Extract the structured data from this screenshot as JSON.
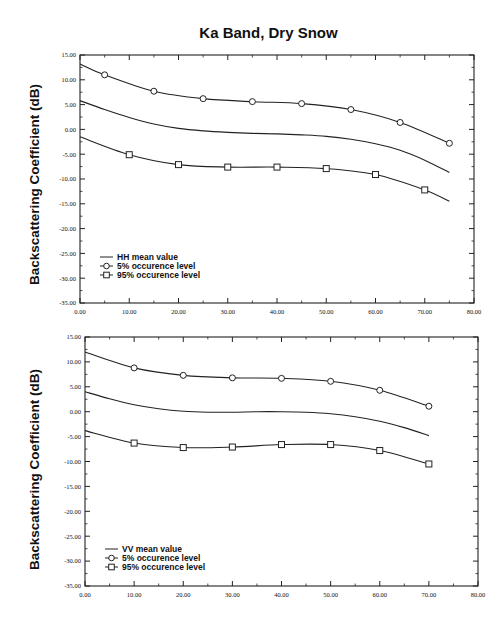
{
  "title": "Ka Band, Dry Snow",
  "chart_data": [
    {
      "type": "line",
      "panel": "top",
      "title": "Ka Band, Dry Snow",
      "xlabel": "",
      "ylabel": "Backscattering Coefficient (dB)",
      "xlim": [
        0,
        80
      ],
      "ylim": [
        -35,
        15
      ],
      "x_ticks": [
        "0.00",
        "10.00",
        "20.00",
        "30.00",
        "40.00",
        "50.00",
        "60.00",
        "70.00",
        "80.00"
      ],
      "y_ticks": [
        "15.00",
        "10.00",
        "5.00",
        "0.00",
        "-5.00",
        "-10.00",
        "-15.00",
        "-20.00",
        "-25.00",
        "-30.00",
        "-35.00"
      ],
      "grid": false,
      "legend_position": "lower-left",
      "series": [
        {
          "name": "HH mean value",
          "marker": "none",
          "x": [
            0,
            5,
            10,
            15,
            20,
            25,
            30,
            35,
            40,
            45,
            50,
            55,
            60,
            65,
            70,
            75
          ],
          "y": [
            5.8,
            4.0,
            2.4,
            1.1,
            0.2,
            -0.3,
            -0.6,
            -0.8,
            -0.9,
            -1.1,
            -1.4,
            -2.0,
            -2.9,
            -4.2,
            -6.2,
            -8.7
          ]
        },
        {
          "name": "5% occurence level",
          "marker": "circle",
          "x": [
            5,
            15,
            25,
            35,
            45,
            55,
            65,
            75
          ],
          "y": [
            11.0,
            7.7,
            6.2,
            5.6,
            5.2,
            4.0,
            1.4,
            -2.8
          ],
          "curve_start": [
            0,
            13.2
          ]
        },
        {
          "name": "95% occurence level",
          "marker": "square",
          "x": [
            10,
            20,
            30,
            40,
            50,
            60,
            70
          ],
          "y": [
            -5.1,
            -7.1,
            -7.6,
            -7.6,
            -7.9,
            -9.1,
            -12.2
          ],
          "curve_start": [
            0,
            -1.5
          ],
          "curve_end": [
            75,
            -14.5
          ]
        }
      ]
    },
    {
      "type": "line",
      "panel": "bottom",
      "title": "",
      "xlabel": "",
      "ylabel": "Backscattering Coefficient (dB)",
      "xlim": [
        0,
        80
      ],
      "ylim": [
        -35,
        15
      ],
      "x_ticks": [
        "0.00",
        "10.00",
        "20.00",
        "30.00",
        "40.00",
        "50.00",
        "60.00",
        "70.00",
        "80.00"
      ],
      "y_ticks": [
        "15.00",
        "10.00",
        "5.00",
        "0.00",
        "-5.00",
        "-10.00",
        "-15.00",
        "-20.00",
        "-25.00",
        "-30.00",
        "-35.00"
      ],
      "grid": false,
      "legend_position": "lower-left",
      "series": [
        {
          "name": "VV mean value",
          "marker": "none",
          "x": [
            0,
            5,
            10,
            15,
            20,
            25,
            30,
            35,
            40,
            45,
            50,
            55,
            60,
            65,
            70
          ],
          "y": [
            4.0,
            2.6,
            1.4,
            0.6,
            0.1,
            -0.1,
            -0.1,
            0.0,
            0.0,
            -0.1,
            -0.4,
            -1.0,
            -1.9,
            -3.2,
            -4.8
          ]
        },
        {
          "name": "5% occurence level",
          "marker": "circle",
          "x": [
            10,
            20,
            30,
            40,
            50,
            60,
            70
          ],
          "y": [
            8.8,
            7.3,
            6.8,
            6.7,
            6.1,
            4.3,
            1.1
          ],
          "curve_start": [
            0,
            12.0
          ]
        },
        {
          "name": "95% occurence level",
          "marker": "square",
          "x": [
            10,
            20,
            30,
            40,
            50,
            60,
            70
          ],
          "y": [
            -6.3,
            -7.2,
            -7.1,
            -6.6,
            -6.6,
            -7.8,
            -10.5
          ],
          "curve_start": [
            0,
            -3.8
          ]
        }
      ]
    }
  ],
  "panels": {
    "top": {
      "ylabel": "Backscattering Coefficient (dB)",
      "legend": [
        "HH mean value",
        " 5% occurence level",
        "95% occurence level"
      ]
    },
    "bottom": {
      "ylabel": "Backscattering Coefficient (dB)",
      "legend": [
        "VV mean value",
        " 5% occurence level",
        "95% occurence level"
      ]
    }
  }
}
